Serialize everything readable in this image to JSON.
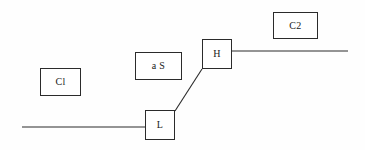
{
  "diagram": {
    "background_color": "#fefefe",
    "stroke_color": "#2b2b2b",
    "nodes": [
      {
        "id": "c1",
        "label": "Cl",
        "name": "node-c1"
      },
      {
        "id": "as",
        "label": "a S",
        "name": "node-as"
      },
      {
        "id": "h",
        "label": "H",
        "name": "node-h"
      },
      {
        "id": "l",
        "label": "L",
        "name": "node-l"
      },
      {
        "id": "c2",
        "label": "C2",
        "name": "node-c2"
      }
    ],
    "edges": [
      {
        "id": "left-line",
        "type": "horizontal",
        "from": "canvas-left",
        "to": "l"
      },
      {
        "id": "l-h-diagonal",
        "type": "diagonal",
        "from": "l",
        "to": "h"
      },
      {
        "id": "right-line",
        "type": "horizontal",
        "from": "h",
        "to": "canvas-right"
      }
    ]
  }
}
